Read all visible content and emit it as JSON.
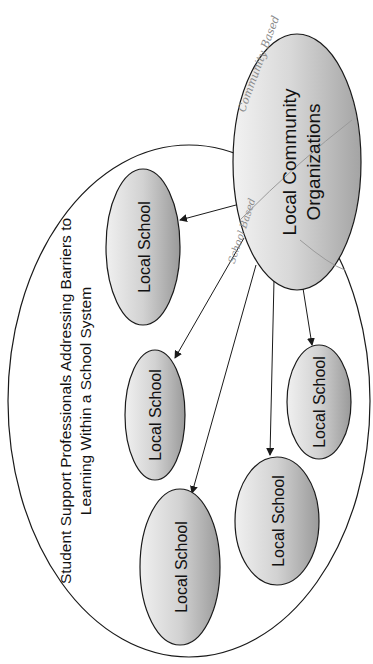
{
  "diagram": {
    "container": {
      "label_line1": "Student Support Professionals Addressing Barriers to",
      "label_line2": "Learning Within a School System"
    },
    "hub": {
      "label_line1": "Local Community",
      "label_line2": "Organizations",
      "annotations": {
        "upper": "Community Based",
        "lower": "School Based"
      }
    },
    "schools": [
      {
        "label": "Local School"
      },
      {
        "label": "Local School"
      },
      {
        "label": "Local School"
      },
      {
        "label": "Local School"
      },
      {
        "label": "Local School"
      }
    ],
    "edges": [
      {
        "from": "hub",
        "to": "school-1"
      },
      {
        "from": "hub",
        "to": "school-2"
      },
      {
        "from": "hub",
        "to": "school-3"
      },
      {
        "from": "hub",
        "to": "school-4"
      },
      {
        "from": "hub",
        "to": "school-5"
      }
    ],
    "colors": {
      "stroke": "#1a1a1a",
      "fill_light": "#ececec",
      "fill_dark": "#9a9a9a",
      "handwriting": "#8a8a8a"
    }
  }
}
